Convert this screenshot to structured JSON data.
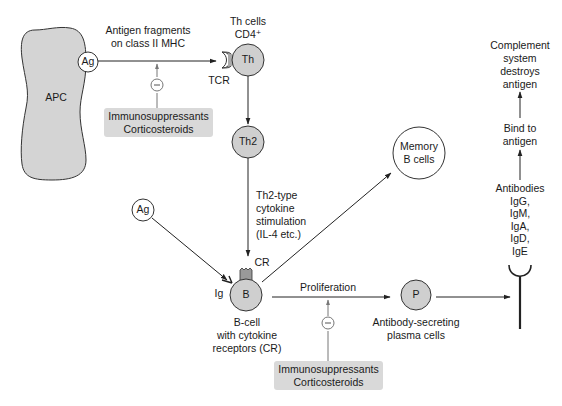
{
  "diagram": {
    "type": "immune-response-pathway",
    "colors": {
      "cell_fill": "#cfcfcf",
      "apc_fill": "#d4d4d4",
      "box_fill": "#d9d9d9",
      "line": "#222222",
      "inhibitor_line": "#777777"
    },
    "nodes": {
      "apc": {
        "label": "APC"
      },
      "ag_top": {
        "label": "Ag"
      },
      "th": {
        "label": "Th",
        "caption_line1": "Th cells",
        "caption_line2": "CD4⁺",
        "receptor_label": "TCR"
      },
      "th2": {
        "label": "Th2"
      },
      "ag_bottom": {
        "label": "Ag"
      },
      "b_cell": {
        "label": "B",
        "receptor_label": "CR",
        "ig_label": "Ig",
        "caption_line1": "B-cell",
        "caption_line2": "with cytokine",
        "caption_line3": "receptors (CR)"
      },
      "memory": {
        "line1": "Memory",
        "line2": "B cells"
      },
      "plasma": {
        "label": "P",
        "caption_line1": "Antibody-secreting",
        "caption_line2": "plasma cells"
      },
      "antibodies": {
        "line1": "Antibodies",
        "line2": "IgG,",
        "line3": "IgM,",
        "line4": "IgA,",
        "line5": "IgD,",
        "line6": "IgE"
      },
      "bind": {
        "line1": "Bind to",
        "line2": "antigen"
      },
      "complement": {
        "line1": "Complement",
        "line2": "system",
        "line3": "destroys",
        "line4": "antigen"
      }
    },
    "edges": {
      "antigen_presentation": {
        "line1": "Antigen fragments",
        "line2": "on class II MHC"
      },
      "cytokine": {
        "line1": "Th2-type",
        "line2": "cytokine",
        "line3": "stimulation",
        "line4": "(IL-4 etc.)"
      },
      "proliferation": {
        "label": "Proliferation"
      }
    },
    "inhibitors": {
      "top": {
        "symbol": "−",
        "line1": "Immunosuppressants",
        "line2": "Corticosteroids"
      },
      "bottom": {
        "symbol": "−",
        "line1": "Immunosuppressants",
        "line2": "Corticosteroids"
      }
    }
  }
}
